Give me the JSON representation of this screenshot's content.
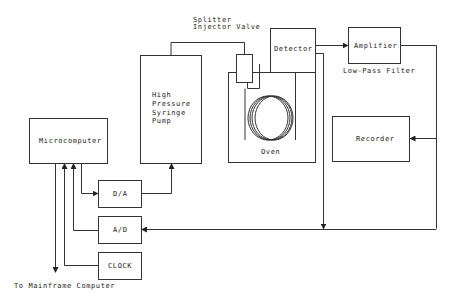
{
  "diagram": {
    "title": "",
    "colors": {
      "line": "#333333",
      "background": "#ffffff"
    },
    "nodes": [
      {
        "id": "microcomputer",
        "label": "Microcomputer"
      },
      {
        "id": "pump",
        "label_lines": [
          "High",
          "Pressure",
          "Syringe",
          "Pump"
        ]
      },
      {
        "id": "valve",
        "label_lines": [
          "Splitter",
          "Injector Valve"
        ]
      },
      {
        "id": "oven",
        "label": "Oven"
      },
      {
        "id": "detector",
        "label": "Detector"
      },
      {
        "id": "amplifier",
        "label": "Amplifier"
      },
      {
        "id": "filter",
        "label": "Low-Pass Filter"
      },
      {
        "id": "recorder",
        "label": "Recorder"
      },
      {
        "id": "da",
        "label": "D/A"
      },
      {
        "id": "ad",
        "label": "A/D"
      },
      {
        "id": "clock",
        "label": "CLOCK"
      },
      {
        "id": "mainframe",
        "label": "To Mainframe Computer"
      }
    ],
    "edges": [
      {
        "from": "microcomputer",
        "to": "da"
      },
      {
        "from": "da",
        "to": "pump"
      },
      {
        "from": "pump",
        "to": "valve"
      },
      {
        "from": "valve",
        "to": "oven"
      },
      {
        "from": "oven",
        "to": "detector"
      },
      {
        "from": "detector",
        "to": "amplifier"
      },
      {
        "from": "amplifier",
        "to": "recorder"
      },
      {
        "from": "amplifier",
        "to": "ad"
      },
      {
        "from": "detector",
        "to": "ad"
      },
      {
        "from": "ad",
        "to": "microcomputer"
      },
      {
        "from": "clock",
        "to": "microcomputer"
      },
      {
        "from": "microcomputer",
        "to": "mainframe"
      }
    ]
  }
}
